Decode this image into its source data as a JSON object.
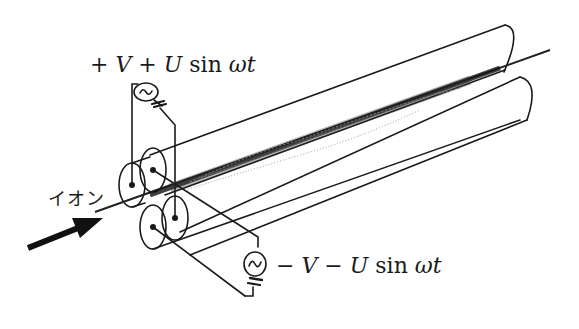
{
  "figure": {
    "labels": {
      "top_voltage": {
        "sign1": "+",
        "V": "V",
        "sign2": "+",
        "U": "U",
        "func": "sin",
        "omega_t": "ωt"
      },
      "bottom_voltage": {
        "sign1": "−",
        "V": "V",
        "sign2": "−",
        "U": "U",
        "func": "sin",
        "omega_t": "ωt"
      },
      "ion": "イオン"
    },
    "components": {
      "rods": [
        "upper-left-rod",
        "upper-right-rod",
        "lower-left-rod",
        "lower-right-rod"
      ],
      "sources": [
        "top-ac-dc-source",
        "bottom-ac-dc-source"
      ],
      "ion_arrow": "ion-input-arrow",
      "ion_beam": "ion-trajectory"
    },
    "colors": {
      "line": "#1a1a1a",
      "beam": "#222222",
      "beam_scatter": "#888888",
      "background": "#ffffff"
    }
  }
}
